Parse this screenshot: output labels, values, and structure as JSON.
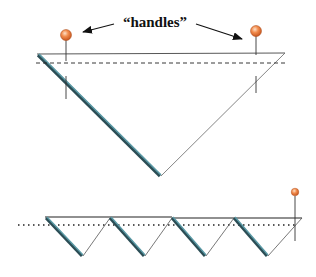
{
  "diagram": {
    "annotation_label": "“handles”",
    "colors": {
      "outline": "#333333",
      "thin_edge": "#555555",
      "folded_edge": "#4e8a96",
      "folded_edge_dark": "#2b4d55",
      "handle_ball": "#f08a4b",
      "handle_ball_highlight": "#fbd2b2",
      "dashed_line": "#222222"
    },
    "top_figure": {
      "description": "single large inverted triangle with two handles",
      "handles": [
        {
          "name": "left-handle"
        },
        {
          "name": "right-handle"
        }
      ]
    },
    "bottom_figure": {
      "description": "row of four inverted triangles with one handle at right",
      "triangle_count": 4,
      "handles": [
        {
          "name": "right-handle"
        }
      ]
    }
  }
}
